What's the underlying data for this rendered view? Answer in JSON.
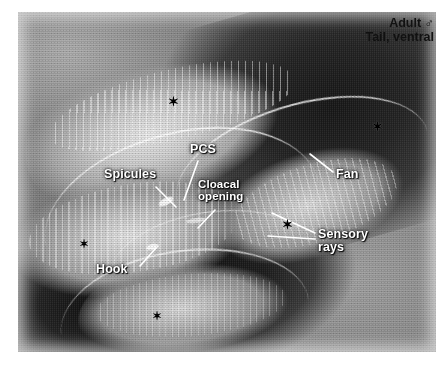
{
  "figure": {
    "type": "scanning-electron-micrograph",
    "plate": {
      "left": 18,
      "top": 12,
      "width": 418,
      "height": 340
    }
  },
  "corner_caption": {
    "line1": "Adult ♂",
    "line2": "Tail, ventral",
    "color": "#111111",
    "font_size": 12.5
  },
  "labels": [
    {
      "name": "spicules",
      "text": "Spicules",
      "x": 104,
      "y": 168,
      "font_size": 12.5,
      "leader": {
        "x1": 156,
        "y1": 187,
        "x2": 176,
        "y2": 207
      }
    },
    {
      "name": "pcs",
      "text": "PCS",
      "x": 190,
      "y": 143,
      "font_size": 12.5,
      "leader": {
        "x1": 198,
        "y1": 161,
        "x2": 184,
        "y2": 200
      }
    },
    {
      "name": "cloacal-opening",
      "text": "Cloacal\nopening",
      "x": 198,
      "y": 178,
      "font_size": 11.5,
      "leader": {
        "x1": 215,
        "y1": 210,
        "x2": 198,
        "y2": 228
      }
    },
    {
      "name": "fan",
      "text": "Fan",
      "x": 336,
      "y": 168,
      "font_size": 12.5,
      "leader": {
        "x1": 333,
        "y1": 172,
        "x2": 310,
        "y2": 154
      }
    },
    {
      "name": "sensory-rays",
      "text": "Sensory\nrays",
      "x": 318,
      "y": 228,
      "font_size": 12.5,
      "leaders": [
        {
          "x1": 315,
          "y1": 233,
          "x2": 272,
          "y2": 213
        },
        {
          "x1": 315,
          "y1": 239,
          "x2": 268,
          "y2": 236
        }
      ]
    },
    {
      "name": "hook",
      "text": "Hook",
      "x": 96,
      "y": 263,
      "font_size": 12.5,
      "leader": {
        "x1": 140,
        "y1": 266,
        "x2": 156,
        "y2": 248
      }
    }
  ],
  "asterisks": [
    {
      "name": "asterisk-upper-left",
      "x": 168,
      "y": 95,
      "size": 13
    },
    {
      "name": "asterisk-upper-right",
      "x": 372,
      "y": 120,
      "size": 13
    },
    {
      "name": "asterisk-mid-left",
      "x": 79,
      "y": 238,
      "size": 12
    },
    {
      "name": "asterisk-center",
      "x": 282,
      "y": 218,
      "size": 13
    },
    {
      "name": "asterisk-lower",
      "x": 152,
      "y": 310,
      "size": 12
    }
  ],
  "palette": {
    "page_background": "#ffffff",
    "plate_midtone": "#8a8a8a",
    "plate_highlight": "#e8e8e8",
    "plate_shadow": "#151515",
    "label_text": "#ffffff",
    "corner_text": "#111111",
    "asterisk": "#000000"
  }
}
